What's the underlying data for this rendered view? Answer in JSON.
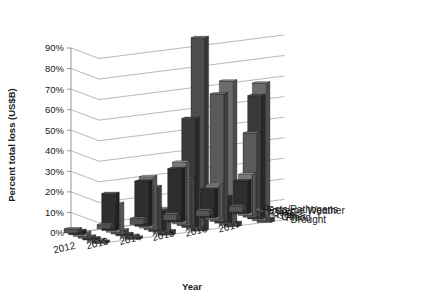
{
  "chart_data": {
    "type": "bar",
    "title": "",
    "subtitle": "",
    "xlabel": "Year",
    "ylabel": "Percent total loss (US$B)",
    "zlabel": "",
    "ylim": [
      0,
      90
    ],
    "ytick_labels": [
      "0%",
      "10%",
      "20%",
      "30%",
      "40%",
      "50%",
      "60%",
      "70%",
      "80%",
      "90%"
    ],
    "ytick_values": [
      0,
      10,
      20,
      30,
      40,
      50,
      60,
      70,
      80,
      90
    ],
    "categories": [
      "2012",
      "2013",
      "2014",
      "2015",
      "2016",
      "2017"
    ],
    "grid": true,
    "legend_position": "right-depth-axis",
    "projection": "3d",
    "series": [
      {
        "name": "Drought",
        "color": "#4d4d4d",
        "values": [
          1,
          1,
          2,
          94,
          2,
          2
        ]
      },
      {
        "name": "Flood",
        "color": "#6b6b6b",
        "values": [
          1,
          1,
          12,
          18,
          70,
          67
        ]
      },
      {
        "name": "Other",
        "color": "#3a3a3a",
        "values": [
          1,
          1,
          10,
          53,
          13,
          60
        ]
      },
      {
        "name": "Heat",
        "color": "#5a5a5a",
        "values": [
          1,
          2,
          21,
          23,
          62,
          41
        ]
      },
      {
        "name": "Cold",
        "color": "#787878",
        "values": [
          2,
          14,
          25,
          30,
          17,
          20
        ]
      },
      {
        "name": "Extreme Weather",
        "color": "#2e2e2e",
        "values": [
          2,
          18,
          22,
          26,
          14,
          16
        ]
      },
      {
        "name": "Pests/Pathogens",
        "color": "#555555",
        "values": [
          2,
          2,
          3,
          3,
          3,
          3
        ]
      }
    ]
  }
}
